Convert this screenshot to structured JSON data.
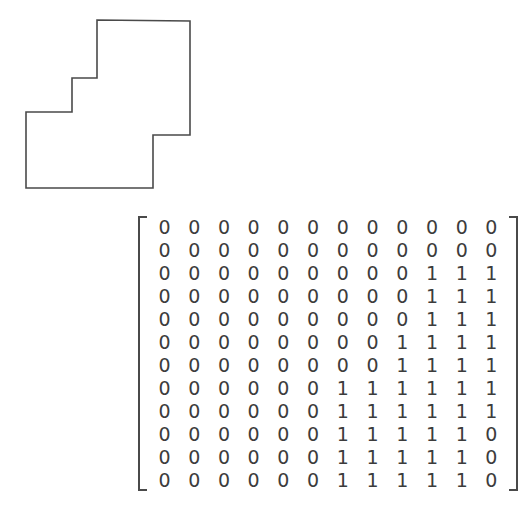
{
  "figure": {
    "name": "staircase-polygon",
    "stroke_color": "#4a4a4a",
    "fill_color": "#ffffff",
    "stroke_width": 1.6,
    "vertices": [
      [
        97,
        20
      ],
      [
        190,
        21
      ],
      [
        190,
        135
      ],
      [
        153,
        135
      ],
      [
        153,
        188
      ],
      [
        26,
        188
      ],
      [
        26,
        112
      ],
      [
        72,
        112
      ],
      [
        72,
        78
      ],
      [
        97,
        78
      ]
    ]
  },
  "matrix": {
    "name": "binary-occupancy-matrix",
    "rows": 12,
    "cols": 12,
    "bracket_color": "#4a4a4a",
    "text_color": "#3c3c3c",
    "values": [
      [
        0,
        0,
        0,
        0,
        0,
        0,
        0,
        0,
        0,
        0,
        0,
        0
      ],
      [
        0,
        0,
        0,
        0,
        0,
        0,
        0,
        0,
        0,
        0,
        0,
        0
      ],
      [
        0,
        0,
        0,
        0,
        0,
        0,
        0,
        0,
        0,
        1,
        1,
        1
      ],
      [
        0,
        0,
        0,
        0,
        0,
        0,
        0,
        0,
        0,
        1,
        1,
        1
      ],
      [
        0,
        0,
        0,
        0,
        0,
        0,
        0,
        0,
        0,
        1,
        1,
        1
      ],
      [
        0,
        0,
        0,
        0,
        0,
        0,
        0,
        0,
        1,
        1,
        1,
        1
      ],
      [
        0,
        0,
        0,
        0,
        0,
        0,
        0,
        0,
        1,
        1,
        1,
        1
      ],
      [
        0,
        0,
        0,
        0,
        0,
        0,
        1,
        1,
        1,
        1,
        1,
        1
      ],
      [
        0,
        0,
        0,
        0,
        0,
        0,
        1,
        1,
        1,
        1,
        1,
        1
      ],
      [
        0,
        0,
        0,
        0,
        0,
        0,
        1,
        1,
        1,
        1,
        1,
        0
      ],
      [
        0,
        0,
        0,
        0,
        0,
        0,
        1,
        1,
        1,
        1,
        1,
        0
      ],
      [
        0,
        0,
        0,
        0,
        0,
        0,
        1,
        1,
        1,
        1,
        1,
        0
      ]
    ]
  }
}
